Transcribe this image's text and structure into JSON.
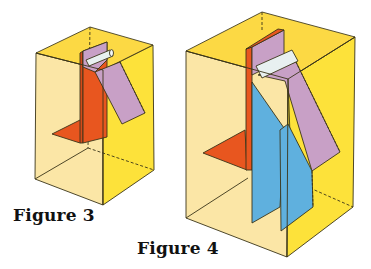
{
  "figures": [
    {
      "id": "figure-3",
      "caption": "Figure 3",
      "description": "Transparent box containing a red L-shaped bracket, a purple slanted plate and a white cylinder hinge"
    },
    {
      "id": "figure-4",
      "caption": "Figure 4",
      "description": "Transparent box containing red bracket, purple slanted plate, white bar and two blue vertical plates"
    }
  ],
  "colors": {
    "box_top": "#fce048",
    "box_left_face": "#fbe6a6",
    "box_right_face": "#fde23a",
    "box_floor": "#fae9b0",
    "edge": "#3a3418",
    "red_plate": "#e8561f",
    "purple_plate": "#c8a0c6",
    "blue_plate": "#5fb0de",
    "white_bar": "#e8f0f0"
  }
}
